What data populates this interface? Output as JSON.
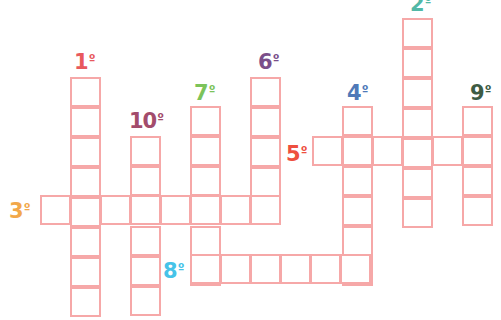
{
  "puzzle": {
    "type": "crossword",
    "cell_border_color": "#f6a8a8",
    "cell_size": 30,
    "words": [
      {
        "id": "1",
        "label": "1",
        "suffix": "º",
        "direction": "down",
        "length": 8,
        "col": 70,
        "row": 77,
        "color": "#e8595d",
        "label_x": 74,
        "label_y": 52
      },
      {
        "id": "2",
        "label": "2",
        "suffix": "º",
        "direction": "down",
        "length": 7,
        "col": 402,
        "row": 18,
        "color": "#52b8a6",
        "label_x": 410,
        "label_y": -6
      },
      {
        "id": "3",
        "label": "3",
        "suffix": "º",
        "direction": "across",
        "length": 8,
        "col": 40,
        "row": 195,
        "color": "#f2a84a",
        "label_x": 9,
        "label_y": 201
      },
      {
        "id": "4",
        "label": "4",
        "suffix": "º",
        "direction": "down",
        "length": 6,
        "col": 342,
        "row": 106,
        "color": "#4f79b8",
        "label_x": 347,
        "label_y": 83
      },
      {
        "id": "5",
        "label": "5",
        "suffix": "º",
        "direction": "across",
        "length": 6,
        "col": 312,
        "row": 136,
        "color": "#ee4f3f",
        "label_x": 286,
        "label_y": 144
      },
      {
        "id": "6",
        "label": "6",
        "suffix": "º",
        "direction": "down",
        "length": 5,
        "col": 250,
        "row": 77,
        "color": "#7b4f8a",
        "label_x": 258,
        "label_y": 52
      },
      {
        "id": "7",
        "label": "7",
        "suffix": "º",
        "direction": "down",
        "length": 6,
        "col": 190,
        "row": 106,
        "color": "#7cc35a",
        "label_x": 194,
        "label_y": 83
      },
      {
        "id": "8",
        "label": "8",
        "suffix": "º",
        "direction": "across",
        "length": 6,
        "col": 190,
        "row": 254,
        "color": "#46c3e8",
        "label_x": 163,
        "label_y": 261
      },
      {
        "id": "9",
        "label": "9",
        "suffix": "º",
        "direction": "down",
        "length": 4,
        "col": 462,
        "row": 106,
        "color": "#3d5b43",
        "label_x": 470,
        "label_y": 83
      },
      {
        "id": "10",
        "label": "10",
        "suffix": "º",
        "direction": "down",
        "length": 6,
        "col": 130,
        "row": 136,
        "color": "#a34c6c",
        "label_x": 129,
        "label_y": 111
      }
    ]
  }
}
